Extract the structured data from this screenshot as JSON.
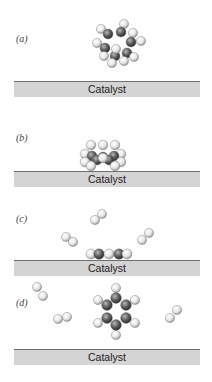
{
  "panels": [
    {
      "label": "(a)",
      "catalyst": "Catalyst",
      "description": "benzene molecule approaching catalyst"
    },
    {
      "label": "(b)",
      "catalyst": "Catalyst",
      "description": "benzene adsorbed flat on catalyst"
    },
    {
      "label": "(c)",
      "catalyst": "Catalyst",
      "description": "hydrogen molecules near adsorbed ring"
    },
    {
      "label": "(d)",
      "catalyst": "Catalyst",
      "description": "planar ring molecule released with hydrogen molecules"
    }
  ],
  "colors": {
    "carbon": "#5a5a5a",
    "hydrogen": "#eeeeee",
    "catalyst_fill": "#d4d4d4",
    "catalyst_edge": "#6e6e6e"
  }
}
